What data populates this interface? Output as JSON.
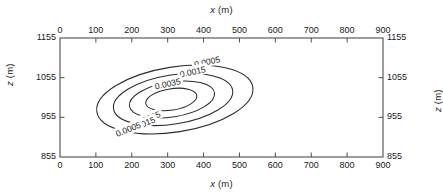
{
  "figure": {
    "background_color": "#ffffff",
    "axes_color": "#4d4d4d",
    "contour_color": "#2b2b2b",
    "text_color": "#1a1a1a"
  },
  "titles": {
    "top": {
      "var": "x",
      "unit": "(m)"
    },
    "bottom": {
      "var": "x",
      "unit": "(m)"
    },
    "left": {
      "var": "z",
      "unit": "(m)"
    },
    "right": {
      "var": "z",
      "unit": "(m)"
    }
  },
  "chart_data": {
    "type": "contour",
    "title": "",
    "xlabel": "x (m)",
    "ylabel": "z (m)",
    "xlim": [
      0,
      900
    ],
    "ylim": [
      855,
      1155
    ],
    "xticks": [
      0,
      100,
      200,
      300,
      400,
      500,
      600,
      700,
      800,
      900
    ],
    "yticks": [
      855,
      955,
      1055,
      1155
    ],
    "xticklabels": [
      "0",
      "100",
      "200",
      "300",
      "400",
      "500",
      "600",
      "700",
      "800",
      "900"
    ],
    "yticklabels": [
      "855",
      "955",
      "1055",
      "1155"
    ],
    "grid": false,
    "legend": null,
    "mirrored_axes": true,
    "tick_direction": "in",
    "levels": [
      0.0005,
      0.0015,
      0.0025,
      0.0035
    ],
    "level_labels": [
      "0.0005",
      "0.0015",
      "0.0025",
      "0.0035"
    ],
    "contours": [
      {
        "level": 0.0005,
        "label": "0.0005",
        "center_x": 320,
        "center_z": 1000,
        "semi_axis_x": 220,
        "semi_axis_z": 82,
        "rotation_deg": -9
      },
      {
        "level": 0.0015,
        "label": "0.0015",
        "center_x": 315,
        "center_z": 1000,
        "semi_axis_x": 168,
        "semi_axis_z": 62,
        "rotation_deg": -9
      },
      {
        "level": 0.0025,
        "label": "0.0025",
        "center_x": 312,
        "center_z": 1000,
        "semi_axis_x": 120,
        "semi_axis_z": 44,
        "rotation_deg": -9
      },
      {
        "level": 0.0035,
        "label": "0.0035",
        "center_x": 310,
        "center_z": 1000,
        "semi_axis_x": 72,
        "semi_axis_z": 27,
        "rotation_deg": -9
      }
    ],
    "inline_labels": [
      {
        "text": "0.0005",
        "x": 410,
        "z": 1095,
        "rotation_deg": -12,
        "side": "upper-right"
      },
      {
        "text": "0.0015",
        "x": 370,
        "z": 1070,
        "rotation_deg": -12,
        "side": "upper-right"
      },
      {
        "text": "0.0035",
        "x": 300,
        "z": 1040,
        "rotation_deg": -12,
        "side": "upper-right"
      },
      {
        "text": "0.0025",
        "x": 245,
        "z": 952,
        "rotation_deg": -22,
        "side": "lower-left"
      },
      {
        "text": "0.0015",
        "x": 230,
        "z": 938,
        "rotation_deg": -22,
        "side": "lower-left"
      },
      {
        "text": "0.0005",
        "x": 190,
        "z": 925,
        "rotation_deg": -22,
        "side": "lower-left"
      }
    ],
    "peak": {
      "x": 310,
      "z": 1000,
      "value_above": 0.0035
    }
  }
}
